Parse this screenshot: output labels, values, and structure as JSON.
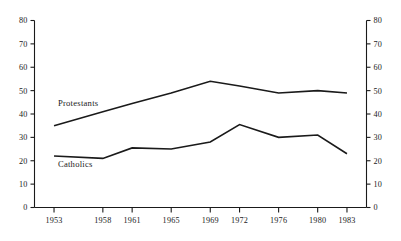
{
  "chart_data": {
    "type": "line",
    "title": "",
    "subtitle": "",
    "xlabel": "",
    "ylabel": "",
    "categories": [
      "1953",
      "1958",
      "1961",
      "1965",
      "1969",
      "1972",
      "1976",
      "1980",
      "1983"
    ],
    "x": [
      1953,
      1958,
      1961,
      1965,
      1969,
      1972,
      1976,
      1980,
      1983
    ],
    "series": [
      {
        "name": "Protestants",
        "values": [
          35,
          41,
          44.5,
          49,
          54,
          52,
          49,
          50,
          49
        ]
      },
      {
        "name": "Catholics",
        "values": [
          22,
          21,
          25.5,
          25,
          28,
          35.5,
          30,
          31,
          23
        ]
      }
    ],
    "ylim": [
      0,
      80
    ],
    "ytick_step": 10,
    "yticks": [
      0,
      10,
      20,
      30,
      40,
      50,
      60,
      70,
      80
    ],
    "ytick_labels_left": [
      "0",
      "10",
      "20",
      "30",
      "40",
      "50",
      "60",
      "70",
      "80"
    ],
    "ytick_labels_right": [
      "0",
      "10",
      "20",
      "30",
      "40",
      "50",
      "60",
      "70",
      "80"
    ],
    "xlim": [
      1951,
      1985
    ],
    "grid": false,
    "legend_position": "inline-annotation",
    "dual_y_axis": true,
    "annotations": [
      {
        "text": "Protestants",
        "x": 1953.4,
        "y": 43.5
      },
      {
        "text": "Catholics",
        "x": 1953.4,
        "y": 17.5
      }
    ],
    "colors": {
      "line": "#1a1a1a",
      "axis": "#1a1a1a",
      "background": "#ffffff",
      "text": "#1a1a1a"
    }
  }
}
